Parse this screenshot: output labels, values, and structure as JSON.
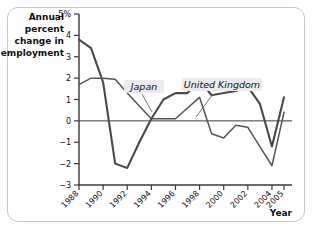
{
  "chart_data": {
    "type": "line",
    "title": "",
    "ylabel": "Annual percent change in employment",
    "xlabel": "Year",
    "ylim": [
      -3,
      5
    ],
    "xlim": [
      1988,
      2005
    ],
    "grid": false,
    "legend_position": "inline-annotations",
    "y_ticks": [
      {
        "value": 5,
        "label": "5%"
      },
      {
        "value": 4,
        "label": "4"
      },
      {
        "value": 3,
        "label": "3"
      },
      {
        "value": 2,
        "label": "2"
      },
      {
        "value": 1,
        "label": "1"
      },
      {
        "value": 0,
        "label": "0"
      },
      {
        "value": -1,
        "label": "−1"
      },
      {
        "value": -2,
        "label": "−2"
      },
      {
        "value": -3,
        "label": "−3"
      }
    ],
    "x_ticks": [
      {
        "value": 1988,
        "label": "1988"
      },
      {
        "value": 1990,
        "label": "1990"
      },
      {
        "value": 1992,
        "label": "1992"
      },
      {
        "value": 1994,
        "label": "1994"
      },
      {
        "value": 1996,
        "label": "1996"
      },
      {
        "value": 1998,
        "label": "1998"
      },
      {
        "value": 2000,
        "label": "2000"
      },
      {
        "value": 2002,
        "label": "2002"
      },
      {
        "value": 2004,
        "label": "2004"
      },
      {
        "value": 2005,
        "label": "2005"
      }
    ],
    "x": [
      1988,
      1989,
      1990,
      1991,
      1992,
      1993,
      1994,
      1995,
      1996,
      1997,
      1998,
      1999,
      2000,
      2001,
      2002,
      2003,
      2004,
      2005
    ],
    "series": [
      {
        "name": "United Kingdom",
        "color": "#4a4a4a",
        "values": [
          3.8,
          3.4,
          1.8,
          -2.0,
          -2.2,
          -1.0,
          0.1,
          1.0,
          1.3,
          1.3,
          1.9,
          1.2,
          1.3,
          1.4,
          1.6,
          0.8,
          -1.2,
          1.1
        ]
      },
      {
        "name": "Japan",
        "color": "#555555",
        "values": [
          1.7,
          2.0,
          2.0,
          1.95,
          1.3,
          0.7,
          0.1,
          0.1,
          0.1,
          0.6,
          1.1,
          -0.6,
          -0.8,
          -0.2,
          -0.3,
          -1.2,
          -2.1,
          0.4
        ]
      }
    ],
    "annotations": [
      {
        "text": "Japan",
        "series": "Japan"
      },
      {
        "text": "United Kingdom",
        "series": "United Kingdom"
      }
    ]
  }
}
